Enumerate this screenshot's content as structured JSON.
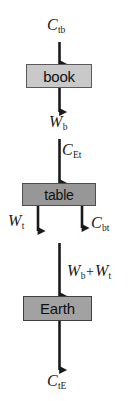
{
  "diagram": {
    "type": "force-interaction-diagram",
    "background_color": "#ffffff",
    "line_color": "#1a1a1a",
    "nodes": [
      {
        "id": "book",
        "label": "book",
        "fill": "#c9c9c9",
        "border": "#5a5a5a"
      },
      {
        "id": "table",
        "label": "table",
        "fill": "#979797",
        "border": "#4e4e4e"
      },
      {
        "id": "earth",
        "label": "Earth",
        "fill": "#a2a2a2",
        "border": "#3f3f3f"
      }
    ],
    "labels": {
      "c_tb": {
        "symbol": "C",
        "subscript": "tb"
      },
      "w_b": {
        "symbol": "W",
        "subscript": "b"
      },
      "c_et": {
        "symbol": "C",
        "subscript": "Et"
      },
      "w_t": {
        "symbol": "W",
        "subscript": "t"
      },
      "c_bt": {
        "symbol": "C",
        "subscript": "bt"
      },
      "w_sum_1": {
        "symbol": "W",
        "subscript": "b"
      },
      "w_sum_op": "+",
      "w_sum_2": {
        "symbol": "W",
        "subscript": "t"
      },
      "c_te": {
        "symbol": "C",
        "subscript": "tE"
      }
    },
    "arrows": [
      {
        "id": "arrow-c-tb",
        "from": "book",
        "direction": "up",
        "label": "c_tb"
      },
      {
        "id": "arrow-w-b",
        "from": "book",
        "direction": "down",
        "label": "w_b"
      },
      {
        "id": "arrow-c-et",
        "from": "table",
        "direction": "up",
        "label": "c_et"
      },
      {
        "id": "arrow-w-t",
        "from": "table",
        "direction": "down",
        "label": "w_t"
      },
      {
        "id": "arrow-c-bt",
        "from": "table",
        "direction": "down",
        "label": "c_bt"
      },
      {
        "id": "arrow-w-sum",
        "from": "earth",
        "direction": "up",
        "label": "w_sum"
      },
      {
        "id": "arrow-c-te",
        "from": "earth",
        "direction": "down",
        "label": "c_te"
      }
    ]
  }
}
